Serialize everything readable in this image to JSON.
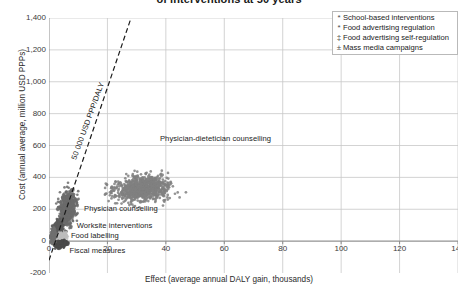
{
  "chart_data": {
    "type": "scatter",
    "title": "of interventions at 50 years",
    "xlabel": "Effect (average annual DALY gain, thousands)",
    "ylabel": "Cost (annual average, million USD PPPs)",
    "xlim": [
      0,
      140
    ],
    "ylim": [
      -200,
      1400
    ],
    "xticks": [
      "0",
      "20",
      "40",
      "60",
      "80",
      "100",
      "120",
      "140"
    ],
    "xtick_values": [
      0,
      20,
      40,
      60,
      80,
      100,
      120,
      140
    ],
    "yticks": [
      "1,400",
      "1,200",
      "1,000",
      "800",
      "600",
      "400",
      "200",
      "0",
      "-200"
    ],
    "ytick_values": [
      1400,
      1200,
      1000,
      800,
      600,
      400,
      200,
      0,
      -200
    ],
    "grid": true,
    "legend_position": "top-right",
    "legend": [
      {
        "marker": "asterisk-marker-icon",
        "label": "School-based interventions"
      },
      {
        "marker": "asterisk-marker-icon",
        "label": "Food advertising regulation"
      },
      {
        "marker": "double-dagger-marker-icon",
        "label": "Food advertising self-regulation"
      },
      {
        "marker": "plus-minus-marker-icon",
        "label": "Mass media campaigns"
      }
    ],
    "reference_line": {
      "label": "50 000 USD PPP/DALY",
      "style": "dashed",
      "color": "#1a1a1a",
      "x0": 0,
      "y0": -120,
      "x1": 29,
      "y1": 1450
    },
    "annotations": [
      {
        "text": "Physician-dietetician counselling",
        "x": 38,
        "y": 640
      },
      {
        "text": "Physician counselling",
        "x": 12,
        "y": 200
      },
      {
        "text": "Worksite interventions",
        "x": 9.5,
        "y": 95
      },
      {
        "text": "Food labelling",
        "x": 7.5,
        "y": 35
      },
      {
        "text": "Fiscal measures",
        "x": 7,
        "y": -65
      }
    ],
    "series": [
      {
        "name": "Physician-dietetician counselling",
        "color": "#808080",
        "center_x": 32,
        "center_y": 330,
        "spread_x": 8,
        "spread_y": 65,
        "n": 900
      },
      {
        "name": "Physician counselling",
        "color": "#6b6b6b",
        "center_x": 6.5,
        "center_y": 205,
        "spread_x": 2.4,
        "spread_y": 85,
        "n": 650
      },
      {
        "name": "Worksite interventions",
        "color": "#5a5a5a",
        "center_x": 3.0,
        "center_y": 70,
        "spread_x": 1.3,
        "spread_y": 45,
        "n": 400
      },
      {
        "name": "Food labelling",
        "color": "#bdbdbd",
        "center_x": 4.2,
        "center_y": 25,
        "spread_x": 1.5,
        "spread_y": 22,
        "n": 260
      },
      {
        "name": "Fiscal measures",
        "color": "#4a4a4a",
        "center_x": 4.0,
        "center_y": -18,
        "spread_x": 1.7,
        "spread_y": 18,
        "n": 300
      },
      {
        "name": "Mass media campaigns",
        "color": "#707070",
        "center_x": 1.4,
        "center_y": 40,
        "spread_x": 0.7,
        "spread_y": 40,
        "n": 180
      }
    ]
  }
}
